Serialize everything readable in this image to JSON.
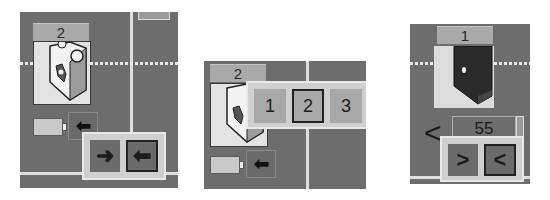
{
  "panels": [
    {
      "id": "left",
      "port_block": {
        "port_number": "2",
        "icon": "motor-block-icon"
      },
      "small_icons": {
        "battery": "battery-icon",
        "direction": "arrow-left-icon"
      },
      "direction_popup": {
        "options": [
          {
            "label": "➜",
            "icon": "arrow-right-icon",
            "selected": false
          },
          {
            "label": "⬅",
            "icon": "arrow-left-icon",
            "selected": true
          }
        ]
      }
    },
    {
      "id": "middle",
      "port_block": {
        "port_number": "2",
        "icon": "motor-block-icon"
      },
      "small_icons": {
        "battery": "battery-icon",
        "direction": "arrow-left-icon"
      },
      "port_popup": {
        "options": [
          {
            "label": "1",
            "selected": false
          },
          {
            "label": "2",
            "selected": true
          },
          {
            "label": "3",
            "selected": false
          }
        ]
      }
    },
    {
      "id": "right",
      "port_block": {
        "port_number": "1",
        "icon": "dark-sensor-block-icon"
      },
      "value_field": {
        "prefix": "<",
        "value": "55"
      },
      "direction_popup": {
        "options": [
          {
            "label": ">",
            "icon": "chevron-right-icon",
            "selected": false
          },
          {
            "label": "<",
            "icon": "chevron-left-icon",
            "selected": true
          }
        ]
      }
    }
  ],
  "colors": {
    "background": "#6d6d6d",
    "label_bg": "#a9a9a9",
    "popup_bg": "#cfcfcf",
    "block_bg": "#e3e3e3"
  }
}
